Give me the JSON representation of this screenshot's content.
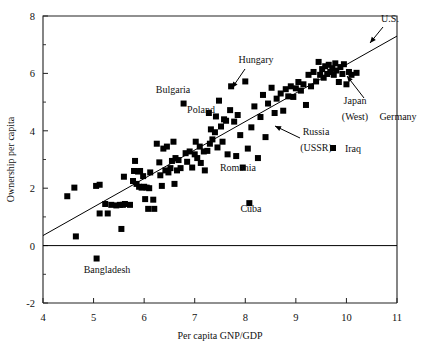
{
  "chart_data": {
    "type": "scatter",
    "title": "",
    "xlabel": "Per capita GNP/GDP",
    "ylabel": "Ownership per capita",
    "xlim": [
      4,
      11
    ],
    "ylim": [
      -2,
      8
    ],
    "xticks": [
      4,
      5,
      6,
      7,
      8,
      9,
      10,
      11
    ],
    "xtick_labels": [
      "4",
      "5",
      "6",
      "7",
      "8",
      "9",
      "10",
      "11"
    ],
    "yticks": [
      -2,
      0,
      2,
      4,
      6,
      8
    ],
    "ytick_labels": [
      "-2",
      "0",
      "2",
      "4",
      "6",
      "8"
    ],
    "y_minor_ticks": [
      -1,
      1,
      3,
      5,
      7
    ],
    "grid": false,
    "legend": null,
    "marker": {
      "shape": "square",
      "color": "#000000",
      "size": 6
    },
    "zero_line": {
      "y": 0,
      "color": "#000000"
    },
    "fit_line": {
      "type": "linear",
      "x0": 4,
      "y0": 0.35,
      "x1": 11,
      "y1": 7.3,
      "color": "#000000"
    },
    "points": [
      [
        4.48,
        1.72
      ],
      [
        4.62,
        2.02
      ],
      [
        4.65,
        0.32
      ],
      [
        5.05,
        2.08
      ],
      [
        5.06,
        -0.45
      ],
      [
        5.12,
        1.12
      ],
      [
        5.12,
        2.12
      ],
      [
        5.23,
        1.45
      ],
      [
        5.28,
        1.12
      ],
      [
        5.35,
        1.42
      ],
      [
        5.45,
        1.4
      ],
      [
        5.52,
        1.42
      ],
      [
        5.55,
        0.58
      ],
      [
        5.58,
        1.42
      ],
      [
        5.62,
        1.45
      ],
      [
        5.6,
        2.4
      ],
      [
        5.72,
        1.42
      ],
      [
        5.78,
        2.25
      ],
      [
        5.8,
        2.6
      ],
      [
        5.82,
        2.95
      ],
      [
        5.85,
        2.15
      ],
      [
        5.88,
        2.58
      ],
      [
        5.9,
        2.05
      ],
      [
        5.92,
        2.6
      ],
      [
        5.95,
        2.02
      ],
      [
        5.98,
        2.42
      ],
      [
        6.0,
        2.05
      ],
      [
        6.02,
        1.62
      ],
      [
        6.05,
        2.02
      ],
      [
        6.08,
        1.28
      ],
      [
        6.1,
        2.0
      ],
      [
        6.12,
        2.55
      ],
      [
        6.18,
        1.6
      ],
      [
        6.2,
        1.28
      ],
      [
        6.25,
        3.55
      ],
      [
        6.3,
        2.9
      ],
      [
        6.32,
        2.45
      ],
      [
        6.35,
        2.08
      ],
      [
        6.38,
        3.38
      ],
      [
        6.42,
        2.62
      ],
      [
        6.45,
        3.45
      ],
      [
        6.48,
        2.55
      ],
      [
        6.52,
        2.7
      ],
      [
        6.55,
        2.95
      ],
      [
        6.58,
        3.62
      ],
      [
        6.6,
        2.15
      ],
      [
        6.62,
        3.05
      ],
      [
        6.65,
        2.62
      ],
      [
        6.68,
        2.98
      ],
      [
        6.72,
        2.7
      ],
      [
        6.78,
        4.95
      ],
      [
        6.82,
        3.22
      ],
      [
        6.85,
        2.92
      ],
      [
        6.9,
        3.28
      ],
      [
        6.95,
        2.72
      ],
      [
        7.0,
        3.18
      ],
      [
        7.02,
        3.62
      ],
      [
        7.05,
        3.05
      ],
      [
        7.1,
        3.45
      ],
      [
        7.12,
        2.88
      ],
      [
        7.18,
        3.28
      ],
      [
        7.2,
        2.62
      ],
      [
        7.25,
        3.3
      ],
      [
        7.28,
        4.62
      ],
      [
        7.3,
        3.55
      ],
      [
        7.32,
        4.05
      ],
      [
        7.35,
        3.7
      ],
      [
        7.4,
        3.95
      ],
      [
        7.42,
        4.5
      ],
      [
        7.45,
        3.42
      ],
      [
        7.48,
        5.05
      ],
      [
        7.52,
        4.15
      ],
      [
        7.55,
        3.62
      ],
      [
        7.58,
        4.4
      ],
      [
        7.62,
        4.35
      ],
      [
        7.65,
        3.18
      ],
      [
        7.7,
        4.72
      ],
      [
        7.72,
        5.55
      ],
      [
        7.78,
        4.32
      ],
      [
        7.82,
        3.12
      ],
      [
        7.85,
        4.55
      ],
      [
        7.9,
        3.85
      ],
      [
        7.95,
        2.72
      ],
      [
        8.0,
        5.72
      ],
      [
        8.05,
        3.38
      ],
      [
        8.08,
        1.48
      ],
      [
        8.12,
        4.12
      ],
      [
        8.18,
        4.85
      ],
      [
        8.25,
        3.05
      ],
      [
        8.3,
        4.48
      ],
      [
        8.35,
        5.25
      ],
      [
        8.4,
        3.78
      ],
      [
        8.45,
        4.95
      ],
      [
        8.52,
        5.5
      ],
      [
        8.58,
        4.62
      ],
      [
        8.62,
        5.12
      ],
      [
        8.7,
        5.3
      ],
      [
        8.75,
        4.7
      ],
      [
        8.8,
        5.45
      ],
      [
        8.85,
        5.2
      ],
      [
        8.9,
        5.55
      ],
      [
        8.95,
        5.18
      ],
      [
        9.0,
        5.48
      ],
      [
        9.05,
        5.7
      ],
      [
        9.1,
        5.4
      ],
      [
        9.15,
        5.62
      ],
      [
        9.2,
        4.9
      ],
      [
        9.25,
        5.95
      ],
      [
        9.3,
        5.55
      ],
      [
        9.35,
        6.05
      ],
      [
        9.4,
        5.72
      ],
      [
        9.45,
        6.4
      ],
      [
        9.48,
        5.95
      ],
      [
        9.52,
        6.15
      ],
      [
        9.55,
        5.85
      ],
      [
        9.58,
        6.25
      ],
      [
        9.62,
        5.98
      ],
      [
        9.65,
        6.3
      ],
      [
        9.68,
        6.05
      ],
      [
        9.72,
        6.18
      ],
      [
        9.75,
        5.95
      ],
      [
        9.78,
        6.35
      ],
      [
        9.8,
        6.1
      ],
      [
        9.85,
        5.7
      ],
      [
        9.88,
        6.22
      ],
      [
        9.92,
        5.98
      ],
      [
        9.95,
        6.32
      ],
      [
        10.0,
        5.62
      ],
      [
        10.05,
        6.05
      ],
      [
        10.1,
        5.95
      ],
      [
        10.2,
        6.02
      ]
    ],
    "annotations": [
      {
        "text": "U.S.",
        "x": 390,
        "y": 22,
        "anchor": "middle",
        "arrow": {
          "x1": 383,
          "y1": 27,
          "x2": 370,
          "y2": 43
        }
      },
      {
        "text": "Hungary",
        "x": 256,
        "y": 63,
        "anchor": "middle",
        "arrow": {
          "x1": 245,
          "y1": 69,
          "x2": 232,
          "y2": 88
        }
      },
      {
        "text": "Bulgaria",
        "x": 173,
        "y": 93,
        "anchor": "middle",
        "arrow": null
      },
      {
        "text": "Poland",
        "x": 201,
        "y": 113,
        "anchor": "middle",
        "arrow": null
      },
      {
        "text": "Japan",
        "x": 355,
        "y": 104,
        "anchor": "middle",
        "arrow": null
      },
      {
        "text": "(West)",
        "x": 355,
        "y": 120,
        "anchor": "middle",
        "arrow": {
          "x1": 364,
          "y1": 98,
          "x2": 347,
          "y2": 76
        }
      },
      {
        "text": "Germany",
        "x": 398,
        "y": 120,
        "anchor": "middle",
        "arrow": null
      },
      {
        "text": "Russia",
        "x": 316,
        "y": 135,
        "anchor": "middle",
        "arrow": null
      },
      {
        "text": "(USSR)",
        "x": 316,
        "y": 151,
        "anchor": "middle",
        "arrow": {
          "x1": 300,
          "y1": 138,
          "x2": 275,
          "y2": 126
        }
      },
      {
        "text": "Iraq",
        "x": 353,
        "y": 152,
        "anchor": "middle",
        "arrow": null
      },
      {
        "text": "Romania",
        "x": 238,
        "y": 171,
        "anchor": "middle",
        "arrow": null
      },
      {
        "text": "Cuba",
        "x": 251,
        "y": 212,
        "anchor": "middle",
        "arrow": null
      },
      {
        "text": "Bangladesh",
        "x": 107,
        "y": 273,
        "anchor": "middle",
        "arrow": null
      }
    ],
    "extra_markers": [
      {
        "name": "iraq-legend-marker",
        "x": 333,
        "y": 148
      }
    ]
  }
}
